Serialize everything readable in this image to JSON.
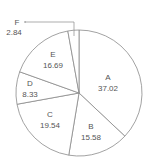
{
  "chart_data": {
    "type": "pie",
    "title": "",
    "start_angle_deg": 0,
    "direction": "clockwise",
    "categories": [
      "A",
      "B",
      "C",
      "D",
      "E",
      "F"
    ],
    "values": [
      37.02,
      15.58,
      19.54,
      8.33,
      16.69,
      2.84
    ],
    "legend": "none",
    "labels_inside": true,
    "annotations": [
      {
        "category": "F",
        "value": "2.84",
        "note": "label outside with leader line"
      }
    ]
  },
  "labels": {
    "A": {
      "name": "A",
      "value": "37.02"
    },
    "B": {
      "name": "B",
      "value": "15.58"
    },
    "C": {
      "name": "C",
      "value": "19.54"
    },
    "D": {
      "name": "D",
      "value": "8.33"
    },
    "E": {
      "name": "E",
      "value": "16.69"
    },
    "F": {
      "name": "F",
      "value": "2.84"
    }
  },
  "colors": {
    "slice_fill": "#ffffff",
    "stroke": "#8a8a8a",
    "text": "#555555"
  }
}
